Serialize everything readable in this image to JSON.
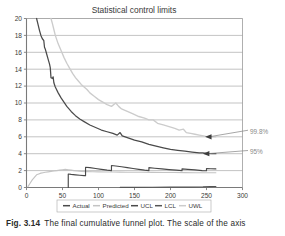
{
  "figure": {
    "caption_label": "Fig. 3.14",
    "caption_text": "The final cumulative funnel plot. The scale of the axis"
  },
  "colors": {
    "actual": "#4a4a4a",
    "predicted": "#c9c9c9",
    "ucl": "#bdbdbd",
    "lcl": "#555555",
    "uwl": "#6e6e6e",
    "axis": "#7a7a7a",
    "grid": "#9a9a9a",
    "text": "#3a3a3a",
    "annotation": "#8a8a8a"
  },
  "chart_data": {
    "type": "line",
    "title": "Statistical control limits",
    "xlabel": "",
    "ylabel": "",
    "xlim": [
      0,
      300
    ],
    "ylim": [
      0,
      20
    ],
    "xticks": [
      0,
      50,
      100,
      150,
      200,
      250,
      300
    ],
    "yticks": [
      0,
      2,
      4,
      6,
      8,
      10,
      12,
      14,
      16,
      18,
      20
    ],
    "grid": "horizontal",
    "legend_position": "bottom",
    "legend": [
      "Actual",
      "Predicted",
      "UCL",
      "LCL",
      "UWL"
    ],
    "annotations": [
      {
        "text": "99.8%",
        "x": 300,
        "y": 6.6,
        "points_to_x": 248,
        "points_to_y": 6.0
      },
      {
        "text": "95%",
        "x": 300,
        "y": 4.2,
        "points_to_x": 245,
        "points_to_y": 4.0
      }
    ],
    "series": [
      {
        "name": "UCL",
        "color": "#4a4a4a",
        "comment": "upper control limit, 99.8% funnel, steep decay with small steps",
        "points": [
          [
            14,
            20.0
          ],
          [
            16,
            19.3
          ],
          [
            18,
            18.6
          ],
          [
            20,
            18.0
          ],
          [
            22,
            17.6
          ],
          [
            24,
            17.4
          ],
          [
            25,
            16.6
          ],
          [
            26,
            16.4
          ],
          [
            28,
            15.8
          ],
          [
            30,
            15.2
          ],
          [
            32,
            14.6
          ],
          [
            33,
            14.2
          ],
          [
            34,
            13.0
          ],
          [
            36,
            12.9
          ],
          [
            37,
            13.1
          ],
          [
            38,
            12.4
          ],
          [
            40,
            11.9
          ],
          [
            44,
            11.2
          ],
          [
            48,
            10.6
          ],
          [
            52,
            10.1
          ],
          [
            56,
            9.6
          ],
          [
            62,
            9.0
          ],
          [
            68,
            8.5
          ],
          [
            74,
            8.1
          ],
          [
            80,
            7.8
          ],
          [
            88,
            7.4
          ],
          [
            96,
            7.1
          ],
          [
            104,
            6.8
          ],
          [
            112,
            6.6
          ],
          [
            120,
            6.4
          ],
          [
            126,
            6.2
          ],
          [
            130,
            6.5
          ],
          [
            133,
            6.1
          ],
          [
            140,
            5.9
          ],
          [
            150,
            5.6
          ],
          [
            160,
            5.4
          ],
          [
            170,
            5.1
          ],
          [
            180,
            4.9
          ],
          [
            190,
            4.7
          ],
          [
            200,
            4.5
          ],
          [
            210,
            4.4
          ],
          [
            220,
            4.3
          ],
          [
            230,
            4.2
          ],
          [
            240,
            4.1
          ],
          [
            245,
            4.1
          ],
          [
            250,
            4.05
          ],
          [
            258,
            4.0
          ],
          [
            263,
            4.0
          ]
        ]
      },
      {
        "name": "UWL",
        "color": "#cccccc",
        "comment": "upper warning limit, 95% funnel, lighter grey, above the UCL curve",
        "points": [
          [
            34,
            20.0
          ],
          [
            36,
            19.4
          ],
          [
            38,
            18.7
          ],
          [
            40,
            18.0
          ],
          [
            44,
            17.0
          ],
          [
            48,
            16.2
          ],
          [
            52,
            15.4
          ],
          [
            56,
            14.7
          ],
          [
            60,
            14.1
          ],
          [
            64,
            13.5
          ],
          [
            68,
            13.0
          ],
          [
            72,
            12.6
          ],
          [
            76,
            12.2
          ],
          [
            80,
            11.9
          ],
          [
            84,
            11.6
          ],
          [
            88,
            11.2
          ],
          [
            94,
            10.8
          ],
          [
            100,
            10.4
          ],
          [
            106,
            10.1
          ],
          [
            112,
            9.8
          ],
          [
            118,
            9.6
          ],
          [
            124,
            10.0
          ],
          [
            128,
            9.6
          ],
          [
            132,
            9.3
          ],
          [
            140,
            9.0
          ],
          [
            148,
            8.7
          ],
          [
            156,
            8.4
          ],
          [
            164,
            8.2
          ],
          [
            170,
            8.0
          ],
          [
            176,
            8.0
          ],
          [
            182,
            7.6
          ],
          [
            190,
            7.4
          ],
          [
            198,
            7.2
          ],
          [
            206,
            7.0
          ],
          [
            212,
            6.8
          ],
          [
            218,
            6.9
          ],
          [
            222,
            6.5
          ],
          [
            228,
            6.4
          ],
          [
            234,
            6.3
          ],
          [
            240,
            6.2
          ],
          [
            246,
            6.1
          ],
          [
            252,
            6.0
          ],
          [
            258,
            6.0
          ],
          [
            263,
            6.0
          ]
        ]
      },
      {
        "name": "Predicted",
        "color": "#c4c4c4",
        "comment": "predicted cumulative rate, rises then flattens around 2",
        "points": [
          [
            2,
            0.1
          ],
          [
            5,
            0.5
          ],
          [
            8,
            0.9
          ],
          [
            11,
            1.2
          ],
          [
            14,
            1.5
          ],
          [
            17,
            1.6
          ],
          [
            20,
            1.7
          ],
          [
            23,
            1.75
          ],
          [
            26,
            1.8
          ],
          [
            30,
            1.85
          ],
          [
            34,
            1.9
          ],
          [
            38,
            1.95
          ],
          [
            42,
            2.0
          ],
          [
            46,
            2.05
          ],
          [
            50,
            2.1
          ],
          [
            54,
            2.15
          ],
          [
            58,
            2.1
          ],
          [
            62,
            2.05
          ],
          [
            66,
            2.0
          ],
          [
            70,
            1.95
          ],
          [
            76,
            1.9
          ],
          [
            84,
            1.88
          ],
          [
            92,
            1.86
          ],
          [
            100,
            1.85
          ],
          [
            110,
            1.84
          ],
          [
            120,
            1.83
          ],
          [
            130,
            1.82
          ],
          [
            140,
            1.81
          ],
          [
            150,
            1.8
          ],
          [
            160,
            1.8
          ],
          [
            175,
            1.79
          ],
          [
            190,
            1.78
          ],
          [
            205,
            1.77
          ],
          [
            220,
            1.76
          ],
          [
            235,
            1.75
          ],
          [
            250,
            1.75
          ],
          [
            263,
            1.75
          ]
        ]
      },
      {
        "name": "Actual",
        "color": "#4a4a4a",
        "comment": "observed cumulative rate, sawtooth: jumps up at events then decays",
        "points": [
          [
            58,
            0.0
          ],
          [
            58,
            1.6
          ],
          [
            62,
            1.55
          ],
          [
            68,
            1.5
          ],
          [
            74,
            1.45
          ],
          [
            80,
            1.4
          ],
          [
            82,
            1.4
          ],
          [
            82,
            2.4
          ],
          [
            88,
            2.35
          ],
          [
            96,
            2.25
          ],
          [
            104,
            2.15
          ],
          [
            112,
            2.05
          ],
          [
            118,
            2.0
          ],
          [
            118,
            2.6
          ],
          [
            124,
            2.55
          ],
          [
            132,
            2.45
          ],
          [
            140,
            2.35
          ],
          [
            148,
            2.25
          ],
          [
            156,
            2.15
          ],
          [
            164,
            2.05
          ],
          [
            170,
            2.0
          ],
          [
            170,
            2.35
          ],
          [
            178,
            2.28
          ],
          [
            188,
            2.2
          ],
          [
            198,
            2.12
          ],
          [
            208,
            2.05
          ],
          [
            216,
            2.0
          ],
          [
            216,
            2.2
          ],
          [
            224,
            2.15
          ],
          [
            234,
            2.08
          ],
          [
            244,
            2.0
          ],
          [
            250,
            1.98
          ],
          [
            250,
            2.25
          ],
          [
            256,
            2.22
          ],
          [
            263,
            2.2
          ]
        ]
      },
      {
        "name": "LCL",
        "color": "#555555",
        "comment": "lower control limit, pinned at zero from about x=130 onwards",
        "points": [
          [
            130,
            0.02
          ],
          [
            150,
            0.02
          ],
          [
            175,
            0.03
          ],
          [
            200,
            0.04
          ],
          [
            225,
            0.05
          ],
          [
            245,
            0.07
          ],
          [
            255,
            0.1
          ],
          [
            263,
            0.12
          ]
        ]
      }
    ]
  }
}
